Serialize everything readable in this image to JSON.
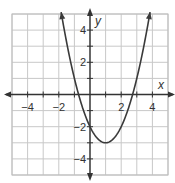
{
  "chart_data": {
    "type": "line",
    "title": "",
    "xlabel": "x",
    "ylabel": "y",
    "xlim": [
      -5,
      5
    ],
    "ylim": [
      -5,
      5
    ],
    "grid": true,
    "x_ticks": [
      -4,
      -2,
      2,
      4
    ],
    "y_ticks": [
      4,
      2,
      -2,
      -4
    ],
    "x_tick_labels": [
      "−4",
      "−2",
      "2",
      "4"
    ],
    "y_tick_labels": [
      "4",
      "2",
      "−2",
      "−4"
    ],
    "series": [
      {
        "name": "parabola",
        "equation": "y = x^2 - 2x - 2",
        "vertex": [
          1,
          -3
        ],
        "y_intercept": -2,
        "x_intercepts": [
          -0.73,
          2.73
        ],
        "x": [
          -1.85,
          -1.5,
          -1,
          -0.5,
          0,
          0.5,
          1,
          1.5,
          2,
          2.5,
          3,
          3.5,
          3.85
        ],
        "values": [
          5.12,
          3.25,
          1,
          -0.75,
          -2,
          -2.75,
          -3,
          -2.75,
          -2,
          -0.75,
          1,
          3.25,
          5.12
        ],
        "arrows_at_ends": true
      }
    ],
    "colors": {
      "grid": "#c8c8c8",
      "axis": "#333333",
      "curve": "#3a3a3a",
      "frame": "#bdbdbd"
    }
  }
}
